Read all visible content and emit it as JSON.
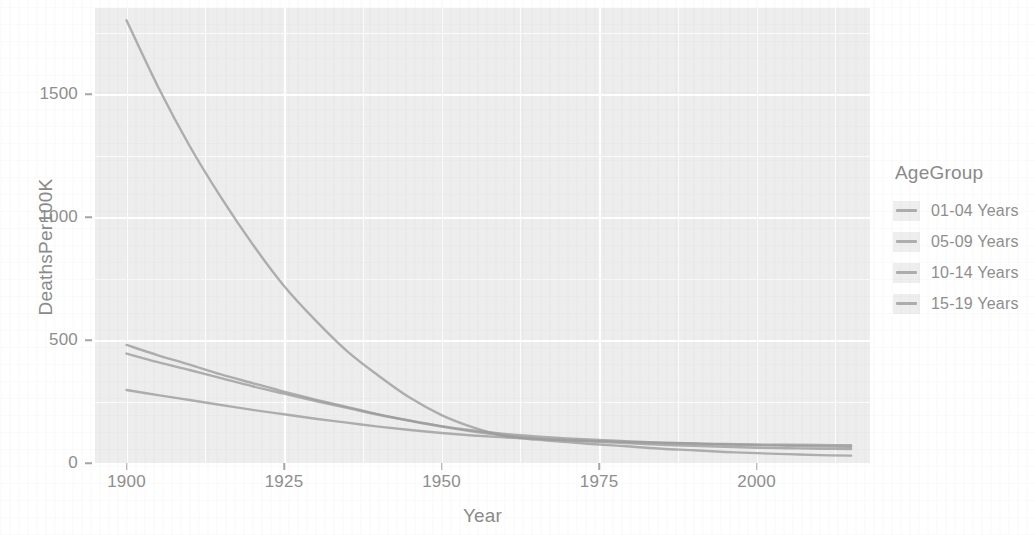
{
  "chart_data": {
    "type": "line",
    "title": "",
    "xlabel": "Year",
    "ylabel": "DeathsPer100K",
    "xlim": [
      1895,
      2018
    ],
    "ylim": [
      0,
      1850
    ],
    "xticks": [
      1900,
      1925,
      1950,
      1975,
      2000
    ],
    "yticks": [
      0,
      500,
      1000,
      1500
    ],
    "grid": true,
    "legend_position": "right",
    "legend_title": "AgeGroup",
    "x": [
      1900,
      1905,
      1910,
      1915,
      1920,
      1925,
      1930,
      1935,
      1940,
      1945,
      1950,
      1955,
      1960,
      1965,
      1970,
      1975,
      1980,
      1985,
      1990,
      1995,
      2000,
      2005,
      2010,
      2015
    ],
    "series": [
      {
        "name": "01-04 Years",
        "color": "#9b9b9b",
        "values": [
          1800,
          1530,
          1290,
          1080,
          890,
          720,
          580,
          455,
          355,
          265,
          195,
          145,
          110,
          95,
          85,
          75,
          67,
          58,
          52,
          45,
          40,
          36,
          32,
          30
        ]
      },
      {
        "name": "05-09 Years",
        "color": "#9b9b9b",
        "values": [
          480,
          438,
          400,
          360,
          325,
          290,
          258,
          228,
          198,
          172,
          148,
          128,
          112,
          100,
          92,
          86,
          80,
          74,
          70,
          66,
          62,
          60,
          58,
          57
        ]
      },
      {
        "name": "10-14 Years",
        "color": "#9b9b9b",
        "values": [
          445,
          410,
          378,
          345,
          312,
          282,
          252,
          224,
          196,
          172,
          150,
          132,
          118,
          108,
          100,
          94,
          88,
          83,
          79,
          75,
          72,
          70,
          68,
          66
        ]
      },
      {
        "name": "15-19 Years",
        "color": "#9b9b9b",
        "values": [
          297,
          276,
          256,
          236,
          216,
          198,
          180,
          164,
          148,
          134,
          122,
          112,
          104,
          98,
          93,
          89,
          85,
          82,
          79,
          77,
          75,
          74,
          73,
          72
        ]
      }
    ]
  },
  "legend": {
    "title": "AgeGroup",
    "items": [
      {
        "label": "01-04 Years",
        "color": "#9b9b9b"
      },
      {
        "label": "05-09 Years",
        "color": "#9b9b9b"
      },
      {
        "label": "10-14 Years",
        "color": "#9b9b9b"
      },
      {
        "label": "15-19 Years",
        "color": "#9b9b9b"
      }
    ]
  },
  "axes": {
    "x_title": "Year",
    "y_title": "DeathsPer100K",
    "x_tick_labels": [
      "1900",
      "1925",
      "1950",
      "1975",
      "2000"
    ],
    "y_tick_labels": [
      "0",
      "500",
      "1000",
      "1500"
    ]
  }
}
